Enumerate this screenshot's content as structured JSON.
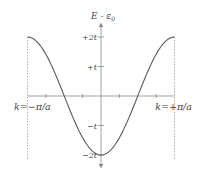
{
  "chart_data": {
    "type": "line",
    "title": "",
    "xlabel": "k",
    "ylabel": "E - ε₀",
    "ylabel_main": "E - ε",
    "ylabel_sub": "0",
    "function": "E - ε0 = -2t cos(ka)",
    "xlim": [
      -1,
      1
    ],
    "x_units": "π/a",
    "ylim": [
      -2,
      2
    ],
    "y_units": "t",
    "grid": false,
    "legend": "none",
    "x_tick_values": [
      -0.75,
      -0.25,
      0.25,
      0.75
    ],
    "x_boundary_labels": [
      {
        "value": -1,
        "label": "k=−π/a"
      },
      {
        "value": 1,
        "label": "k=+π/a"
      }
    ],
    "y_ticks": [
      {
        "value": 2,
        "label": "+2t"
      },
      {
        "value": 1,
        "label": "+t"
      },
      {
        "value": -1,
        "label": "−t"
      },
      {
        "value": -2,
        "label": "−2t"
      }
    ],
    "series": [
      {
        "name": "dispersion",
        "x": [
          -1,
          -0.875,
          -0.75,
          -0.625,
          -0.5,
          -0.375,
          -0.25,
          -0.125,
          0,
          0.125,
          0.25,
          0.375,
          0.5,
          0.625,
          0.75,
          0.875,
          1
        ],
        "values": [
          2,
          1.848,
          1.414,
          0.765,
          0,
          -0.765,
          -1.414,
          -1.848,
          -2,
          -1.848,
          -1.414,
          -0.765,
          0,
          0.765,
          1.414,
          1.848,
          2
        ]
      }
    ],
    "boundary_lines": [
      -1,
      1
    ],
    "boundary_style": "dashed"
  }
}
